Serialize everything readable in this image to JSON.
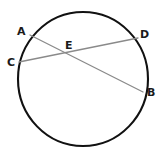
{
  "figure": {
    "kind": "geometry-diagram",
    "width": 164,
    "height": 154,
    "background_color": "#ffffff"
  },
  "style": {
    "circle_stroke_color": "#111111",
    "circle_stroke_width": 2.1,
    "chord_stroke_color": "#8a8a8a",
    "chord_stroke_width": 1.3,
    "label_color": "#1a1a1a",
    "label_font_size": 11
  },
  "circle": {
    "name": "main-circle",
    "center_x": 83,
    "center_y": 79,
    "radius_x": 65,
    "radius_y": 67
  },
  "points": [
    {
      "id": "A",
      "label": "A",
      "x": 30,
      "y": 35,
      "label_x": 17,
      "label_y": 26,
      "on_circle": true
    },
    {
      "id": "C",
      "label": "C",
      "x": 19,
      "y": 62,
      "label_x": 7,
      "label_y": 57,
      "on_circle": true
    },
    {
      "id": "D",
      "label": "D",
      "x": 138,
      "y": 38,
      "label_x": 140,
      "label_y": 29,
      "on_circle": true
    },
    {
      "id": "B",
      "label": "B",
      "x": 143,
      "y": 92,
      "label_x": 147,
      "label_y": 87,
      "on_circle": true
    },
    {
      "id": "E",
      "label": "E",
      "x": 71,
      "y": 54,
      "label_x": 65,
      "label_y": 40,
      "on_circle": false
    }
  ],
  "chords": [
    {
      "id": "AB",
      "name": "chord-a-b",
      "from": "A",
      "to": "B",
      "x1": 30,
      "y1": 35,
      "x2": 143,
      "y2": 92
    },
    {
      "id": "CD",
      "name": "chord-c-d",
      "from": "C",
      "to": "D",
      "x1": 19,
      "y1": 62,
      "x2": 138,
      "y2": 38
    }
  ],
  "intersection": {
    "id": "E",
    "label": "E",
    "x": 71,
    "y": 54,
    "of": [
      "AB",
      "CD"
    ]
  }
}
